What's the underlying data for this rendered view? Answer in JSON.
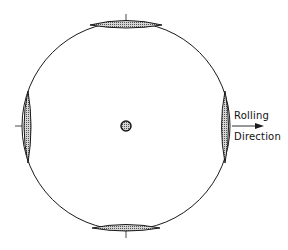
{
  "diagram": {
    "type": "pole-figure",
    "circle": {
      "cx": 126,
      "cy": 126,
      "r": 104
    },
    "colors": {
      "stroke": "#1a1a1a",
      "fill": "#b8b8b8",
      "background": "#ffffff"
    },
    "poles": [
      {
        "name": "top",
        "position": "top"
      },
      {
        "name": "bottom",
        "position": "bottom"
      },
      {
        "name": "left",
        "position": "left"
      },
      {
        "name": "right",
        "position": "right"
      },
      {
        "name": "center",
        "position": "center"
      }
    ],
    "annotation": {
      "line1": "Rolling",
      "line2": "Direction",
      "arrow": "right-arrow"
    }
  }
}
